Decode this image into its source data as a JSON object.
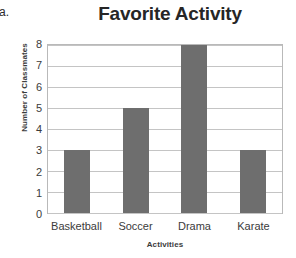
{
  "item_marker": "a.",
  "chart_data": {
    "type": "bar",
    "title": "Favorite Activity",
    "xlabel": "Activities",
    "ylabel": "Number of Classmates",
    "categories": [
      "Basketball",
      "Soccer",
      "Drama",
      "Karate"
    ],
    "values": [
      3,
      5,
      8,
      3
    ],
    "yticks": [
      0,
      1,
      2,
      3,
      4,
      5,
      6,
      7,
      8
    ],
    "ylim": [
      0,
      8
    ],
    "grid": true,
    "legend": false,
    "bar_color": "#6e6e6e",
    "grid_color": "#c4c4c4",
    "plot_border_color": "#b9b9b9",
    "background_color": "#ffffff"
  }
}
